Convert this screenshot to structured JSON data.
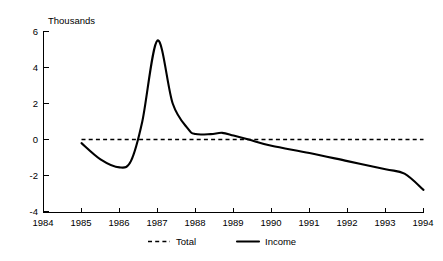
{
  "chart_data": {
    "type": "line",
    "title": "",
    "subtitle": "",
    "xlabel": "",
    "ylabel": "Thousands",
    "ylabel_position": "top-left",
    "xlim": [
      1984,
      1994
    ],
    "ylim": [
      -4,
      6
    ],
    "grid": false,
    "legend_position": "bottom-center",
    "x_ticks": [
      "1984",
      "1985",
      "1986",
      "1987",
      "1988",
      "1989",
      "1990",
      "1991",
      "1992",
      "1993",
      "1994"
    ],
    "y_ticks": [
      "6",
      "4",
      "2",
      "0",
      "-2",
      "-4"
    ],
    "x_tick_values": [
      1984,
      1985,
      1986,
      1987,
      1988,
      1989,
      1990,
      1991,
      1992,
      1993,
      1994
    ],
    "y_tick_values": [
      6,
      4,
      2,
      0,
      -2,
      -4
    ],
    "series": [
      {
        "name": "Total",
        "style": "dashed",
        "color": "#000000",
        "x": [
          1985,
          1986,
          1987,
          1988,
          1989,
          1990,
          1991,
          1992,
          1993,
          1994
        ],
        "values": [
          0,
          0,
          0,
          0,
          0,
          0,
          0,
          0,
          0,
          0
        ]
      },
      {
        "name": "Income",
        "style": "solid",
        "color": "#000000",
        "x": [
          1985,
          1985.5,
          1986,
          1986.3,
          1986.6,
          1987,
          1987.4,
          1987.8,
          1988,
          1988.4,
          1988.7,
          1989,
          1989.4,
          1990,
          1991,
          1992,
          1993,
          1993.5,
          1994
        ],
        "values": [
          -0.2,
          -1.1,
          -1.55,
          -1.2,
          1.0,
          5.5,
          2.0,
          0.6,
          0.3,
          0.3,
          0.37,
          0.22,
          0.0,
          -0.35,
          -0.75,
          -1.2,
          -1.65,
          -1.9,
          -2.8
        ]
      }
    ],
    "annotations": []
  },
  "legend": {
    "items": [
      {
        "label": "Total",
        "style": "dashed"
      },
      {
        "label": "Income",
        "style": "solid"
      }
    ]
  }
}
